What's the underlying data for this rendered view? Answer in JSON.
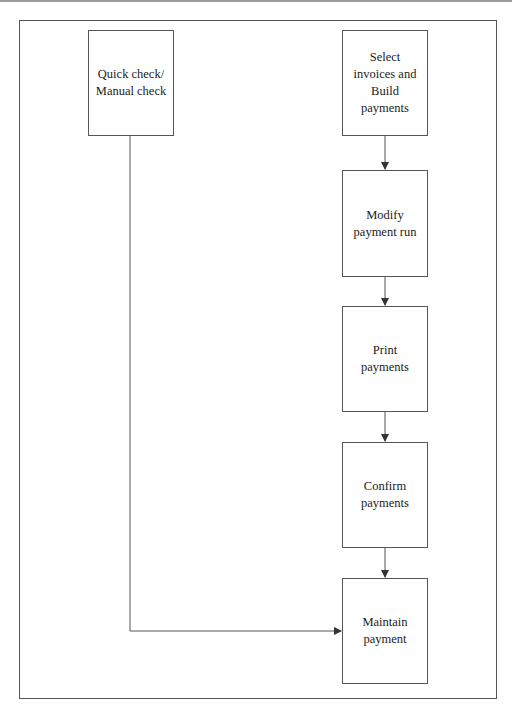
{
  "diagram": {
    "type": "flowchart",
    "nodes": [
      {
        "id": "quick_check",
        "label": "Quick check/\nManual check"
      },
      {
        "id": "select_invoices",
        "label": "Select\ninvoices and\nBuild\npayments"
      },
      {
        "id": "modify_run",
        "label": "Modify\npayment run"
      },
      {
        "id": "print_payments",
        "label": "Print\npayments"
      },
      {
        "id": "confirm_payments",
        "label": "Confirm\npayments"
      },
      {
        "id": "maintain_payment",
        "label": "Maintain\npayment"
      }
    ],
    "edges": [
      {
        "from": "select_invoices",
        "to": "modify_run"
      },
      {
        "from": "modify_run",
        "to": "print_payments"
      },
      {
        "from": "print_payments",
        "to": "confirm_payments"
      },
      {
        "from": "confirm_payments",
        "to": "maintain_payment"
      },
      {
        "from": "quick_check",
        "to": "maintain_payment"
      }
    ]
  },
  "colors": {
    "line": "#555555",
    "background": "#ffffff"
  }
}
